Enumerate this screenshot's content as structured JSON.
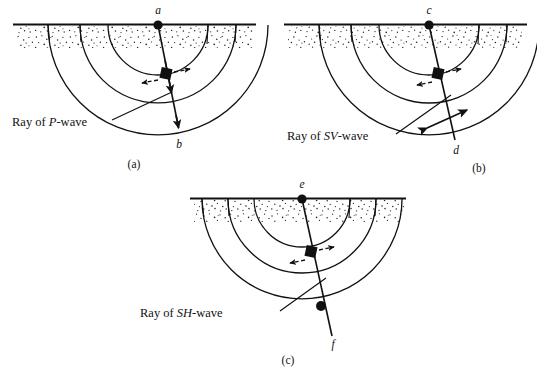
{
  "figure": {
    "title_caption_style": "(a) (b) (c)",
    "surface_label": "ground-surface",
    "panels": [
      {
        "id": "a",
        "caption": "(a)",
        "source_label": "a",
        "terminus_label": "b",
        "ray_label_prefix": "Ray of ",
        "ray_label_wave": "P",
        "ray_label_suffix": "-wave",
        "ray_label_full": "Ray of P-wave",
        "motion_type": "parallel-to-ray",
        "motion_marker": "double-arrow-along-ray",
        "terminus_marker": "arrowhead",
        "wave": "P"
      },
      {
        "id": "b",
        "caption": "(b)",
        "source_label": "c",
        "terminus_label": "d",
        "ray_label_prefix": "Ray of ",
        "ray_label_wave": "SV",
        "ray_label_suffix": "-wave",
        "ray_label_full": "Ray of SV-wave",
        "motion_type": "perpendicular-in-plane",
        "motion_marker": "double-headed-arrow-across-ray",
        "terminus_marker": "double-headed-arrow",
        "wave": "SV"
      },
      {
        "id": "c",
        "caption": "(c)",
        "source_label": "e",
        "terminus_label": "f",
        "ray_label_prefix": "Ray of ",
        "ray_label_wave": "SH",
        "ray_label_suffix": "-wave",
        "ray_label_full": "Ray of SH-wave",
        "motion_type": "perpendicular-out-of-plane",
        "motion_marker": "dot-on-ray",
        "terminus_marker": "filled-dot",
        "wave": "SH"
      }
    ],
    "wavefront_count": 3,
    "colors": {
      "ink": "#111111",
      "background": "#ffffff",
      "stipple": "#333333"
    }
  }
}
